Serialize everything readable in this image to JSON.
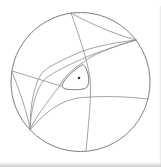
{
  "figure": {
    "kind": "phase-portrait-diagram",
    "canvas": {
      "width": 161,
      "height": 167
    },
    "background_color": "#ffffff",
    "line_color": "#8c8c8c",
    "circle_color": "#6f6f6f",
    "dot_color": "#3a3a3a",
    "edge_shadow_color": "#b8b8b8",
    "boundary_circle": {
      "cx": 80.5,
      "cy": 82,
      "r": 69.5,
      "stroke_width": 0.9
    },
    "equilibrium_dot": {
      "cx": 79,
      "cy": 78,
      "r": 1.3
    },
    "limit_cycle": {
      "name": "limit-cycle-triangle",
      "stroke_width": 0.9,
      "d": "M83,64.5 C78,67 66,76 62.5,84 C61.5,86.5 63,88.5 66,89 C72,90.2 82,90 86,88 C88.5,86.5 89.5,80 88,74 C87,70 85.5,66.5 83,64.5 Z"
    },
    "curves": [
      {
        "name": "separatrix-vertical-top-to-bottom",
        "stroke_width": 0.8,
        "d": "M71,13 C78,33 87,58 90,78 C92,95 88,128 86,151.5"
      },
      {
        "name": "separatrix-chord-top-to-right-cusp",
        "stroke_width": 0.8,
        "d": "M71,13 C91,24 114,34 136,40"
      },
      {
        "name": "separatrix-right-cusp-outer",
        "stroke_width": 0.8,
        "d": "M136,40 C112,43 92,47 78,53 C62,60 50,66 44,71 C35,79 30,104 30,129"
      },
      {
        "name": "separatrix-right-cusp-inner",
        "stroke_width": 0.8,
        "d": "M136,40 C114,47 95,53 82,59 C66,66 53,73 46,78 C37,86 31,108 30,129"
      },
      {
        "name": "separatrix-hugging-limit-cycle",
        "stroke_width": 0.8,
        "d": "M136,40 C117,45 100,52 91,57 C87,59.5 85,60.5 84,62 C76,66.5 64,76 59.5,86 C52,96 39,112 31,127.5"
      },
      {
        "name": "separatrix-left-to-cycle-tail",
        "stroke_width": 0.8,
        "d": "M12,71 C32,77 48,82 61,86"
      },
      {
        "name": "separatrix-left-to-lower-cusp",
        "stroke_width": 0.8,
        "d": "M12.5,73 C20,92 27,112 30,129"
      },
      {
        "name": "separatrix-horizontal-to-right-edge",
        "stroke_width": 0.8,
        "d": "M30,130 C45,112 60,101 78,98 C102,95.5 126,96.5 148,99"
      }
    ]
  }
}
